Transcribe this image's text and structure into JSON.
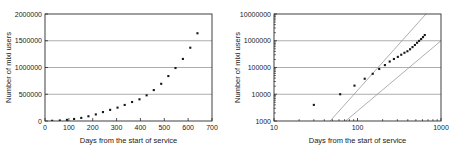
{
  "figure": {
    "panels": [
      "left",
      "right"
    ]
  },
  "chart_data": [
    {
      "id": "linear-panel",
      "type": "scatter",
      "title": "",
      "xlabel": "Days from the start of service",
      "ylabel": "Number of mixi users",
      "xscale": "linear",
      "yscale": "linear",
      "xlim": [
        0,
        700
      ],
      "ylim": [
        0,
        2000000
      ],
      "xticks": [
        0,
        100,
        200,
        300,
        400,
        500,
        600,
        700
      ],
      "xtick_labels": [
        "0",
        "100",
        "200",
        "300",
        "400",
        "500",
        "600",
        "700"
      ],
      "yticks": [
        0,
        500000,
        1000000,
        1500000,
        2000000
      ],
      "ytick_labels": [
        "0",
        "500000",
        "1000000",
        "1500000",
        "2000000"
      ],
      "grid": "horizontal",
      "legend": "none",
      "series": [
        {
          "name": "mixi users",
          "marker": "square",
          "color": "#161616",
          "x": [
            30,
            62,
            92,
            122,
            152,
            182,
            213,
            243,
            273,
            304,
            334,
            365,
            396,
            426,
            456,
            487,
            517,
            547,
            578,
            609,
            639
          ],
          "y": [
            4000,
            10000,
            21000,
            38000,
            58000,
            88000,
            123000,
            167000,
            208000,
            250000,
            300000,
            355000,
            405000,
            480000,
            578000,
            695000,
            840000,
            990000,
            1160000,
            1370000,
            1640000,
            1940000
          ]
        }
      ]
    },
    {
      "id": "loglog-panel",
      "type": "scatter",
      "title": "",
      "xlabel": "Days from the start of service",
      "ylabel": "Number of mixi users",
      "xscale": "log",
      "yscale": "log",
      "xlim": [
        10,
        1000
      ],
      "ylim": [
        1000,
        10000000
      ],
      "xticks": [
        10,
        100,
        1000
      ],
      "xtick_labels": [
        "10",
        "100",
        "1000"
      ],
      "yticks": [
        1000,
        10000,
        100000,
        1000000,
        10000000
      ],
      "ytick_labels": [
        "1000",
        "10000",
        "100000",
        "1000000",
        "10000000"
      ],
      "grid": "horizontal",
      "legend": "none",
      "series": [
        {
          "name": "mixi users",
          "marker": "square",
          "color": "#161616",
          "x": [
            30,
            62,
            92,
            122,
            152,
            182,
            213,
            243,
            273,
            304,
            334,
            365,
            396,
            426,
            456,
            487,
            517,
            547,
            578,
            609,
            639
          ],
          "y": [
            4000,
            10000,
            21000,
            38000,
            58000,
            88000,
            123000,
            167000,
            208000,
            250000,
            300000,
            355000,
            405000,
            480000,
            578000,
            695000,
            840000,
            990000,
            1160000,
            1370000,
            1640000,
            1940000
          ]
        }
      ],
      "reference_lines": [
        {
          "name": "upper-guide-line",
          "color": "#9a9a9a",
          "x": [
            47,
            660
          ],
          "y": [
            1000,
            10000000
          ]
        },
        {
          "name": "lower-guide-line",
          "color": "#9a9a9a",
          "x": [
            72,
            1000
          ],
          "y": [
            1000,
            1000000
          ]
        }
      ]
    }
  ]
}
